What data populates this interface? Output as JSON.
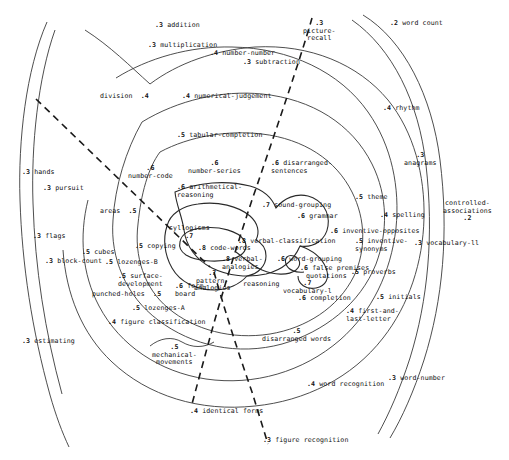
{
  "figure": {
    "type": "radex-contour-map",
    "title": "",
    "colors": {
      "contour": "#3a3a3a",
      "divider": "#1a1a1a",
      "text": "#111111",
      "background": "#ffffff"
    }
  },
  "chart_data": {
    "type": "scatter",
    "title": "",
    "xlabel": "",
    "ylabel": "",
    "grid": false,
    "legend": null,
    "annotations": [
      "dashed radial divider lines partition the radex into sectors"
    ],
    "points": [
      {
        "label": "addition",
        "value": ".3",
        "value_pos": "before",
        "x": 155,
        "y": 22,
        "align": "left"
      },
      {
        "label": "multiplication",
        "value": ".3",
        "value_pos": "before",
        "x": 148,
        "y": 42,
        "align": "left"
      },
      {
        "label": "number-number",
        "value": ".4",
        "value_pos": "before",
        "x": 210,
        "y": 50,
        "align": "left"
      },
      {
        "label": "subtraction",
        "value": ".3",
        "value_pos": "before",
        "x": 243,
        "y": 59,
        "align": "left"
      },
      {
        "label": "picture-\nrecall",
        "value": ".3",
        "value_pos": "above",
        "x": 303,
        "y": 20,
        "align": "left"
      },
      {
        "label": "word count",
        "value": ".2",
        "value_pos": "before",
        "x": 390,
        "y": 20,
        "align": "left"
      },
      {
        "label": "division",
        "value": ".4",
        "value_pos": "after",
        "x": 100,
        "y": 93,
        "align": "left"
      },
      {
        "label": "numerical-judgement",
        "value": ".4",
        "value_pos": "before",
        "x": 182,
        "y": 93,
        "align": "left"
      },
      {
        "label": "rhythm",
        "value": ".4",
        "value_pos": "before",
        "x": 383,
        "y": 105,
        "align": "left"
      },
      {
        "label": "tabular-completion",
        "value": ".5",
        "value_pos": "before",
        "x": 177,
        "y": 132,
        "align": "left"
      },
      {
        "label": "anagrams",
        "value": ".3",
        "value_pos": "above",
        "x": 404,
        "y": 152,
        "align": "left"
      },
      {
        "label": "number-code",
        "value": ".6",
        "value_pos": "above",
        "x": 128,
        "y": 165,
        "align": "left"
      },
      {
        "label": "number-series",
        "value": ".6",
        "value_pos": "above",
        "x": 188,
        "y": 160,
        "align": "left"
      },
      {
        "label": "disarranged-\nsentences",
        "value": ".6",
        "value_pos": "before",
        "x": 271,
        "y": 160,
        "align": "left"
      },
      {
        "label": "hands",
        "value": ".3",
        "value_pos": "before",
        "x": 22,
        "y": 169,
        "align": "left"
      },
      {
        "label": "arithmetical-\nreasoning",
        "value": ".6",
        "value_pos": "before",
        "x": 177,
        "y": 184,
        "align": "left"
      },
      {
        "label": "pursuit",
        "value": ".3",
        "value_pos": "before",
        "x": 43,
        "y": 185,
        "align": "left"
      },
      {
        "label": "theme",
        "value": ".5",
        "value_pos": "before",
        "x": 355,
        "y": 194,
        "align": "left"
      },
      {
        "label": "controlled-\nassociations",
        "value": ".2",
        "value_pos": "below",
        "x": 443,
        "y": 200,
        "align": "left"
      },
      {
        "label": "sound-grouping",
        "value": ".7",
        "value_pos": "before",
        "x": 262,
        "y": 202,
        "align": "left"
      },
      {
        "label": "areas",
        "value": ".5",
        "value_pos": "after",
        "x": 100,
        "y": 208,
        "align": "left"
      },
      {
        "label": "grammar",
        "value": ".6",
        "value_pos": "before",
        "x": 297,
        "y": 213,
        "align": "left"
      },
      {
        "label": "spelling",
        "value": ".4",
        "value_pos": "before",
        "x": 380,
        "y": 212,
        "align": "left"
      },
      {
        "label": "flags",
        "value": ".3",
        "value_pos": "before",
        "x": 33,
        "y": 233,
        "align": "left"
      },
      {
        "label": "inventive-opposites",
        "value": ".6",
        "value_pos": "before",
        "x": 330,
        "y": 228,
        "align": "left"
      },
      {
        "label": "syllogisms",
        "value": ".7",
        "value_pos": "below",
        "x": 169,
        "y": 225,
        "align": "left"
      },
      {
        "label": "verbal-classification",
        "value": ".8",
        "value_pos": "before",
        "x": 238,
        "y": 238,
        "align": "left"
      },
      {
        "label": "inventive-\nsynonyms",
        "value": ".5",
        "value_pos": "before",
        "x": 355,
        "y": 238,
        "align": "left"
      },
      {
        "label": "vocabulary-ll",
        "value": ".3",
        "value_pos": "before",
        "x": 414,
        "y": 240,
        "align": "left"
      },
      {
        "label": "copying",
        "value": ".5",
        "value_pos": "before",
        "x": 135,
        "y": 243,
        "align": "left"
      },
      {
        "label": "code-words",
        "value": ".8",
        "value_pos": "before",
        "x": 198,
        "y": 245,
        "align": "left"
      },
      {
        "label": "cubes",
        "value": ".5",
        "value_pos": "before",
        "x": 82,
        "y": 249,
        "align": "left"
      },
      {
        "label": "block-count",
        "value": ".3",
        "value_pos": "before",
        "x": 45,
        "y": 258,
        "align": "left"
      },
      {
        "label": "lozenges-B",
        "value": ".5",
        "value_pos": "before",
        "x": 105,
        "y": 259,
        "align": "left"
      },
      {
        "label": "verbal-\nanalogies",
        "value": ".8",
        "value_pos": "before",
        "x": 222,
        "y": 256,
        "align": "left"
      },
      {
        "label": "word-grouping",
        "value": ".6",
        "value_pos": "before",
        "x": 277,
        "y": 256,
        "align": "left"
      },
      {
        "label": "false premises",
        "value": ".6",
        "value_pos": "before",
        "x": 300,
        "y": 265,
        "align": "left"
      },
      {
        "label": "proverbs",
        "value": ".5",
        "value_pos": "before",
        "x": 351,
        "y": 269,
        "align": "left"
      },
      {
        "label": "surface-\ndevelopment",
        "value": ".5",
        "value_pos": "before",
        "x": 118,
        "y": 273,
        "align": "left"
      },
      {
        "label": "pattern-\nanalogies",
        "value": ".7",
        "value_pos": "above",
        "x": 194,
        "y": 270,
        "align": "left"
      },
      {
        "label": "quotations",
        "value": ".6",
        "value_pos": "none",
        "x": 306,
        "y": 273,
        "align": "left"
      },
      {
        "label": "form-\nboard",
        "value": ".6",
        "value_pos": "before",
        "x": 175,
        "y": 283,
        "align": "left"
      },
      {
        "label": "reasoning",
        "value": ".6",
        "value_pos": "none",
        "x": 243,
        "y": 281,
        "align": "left"
      },
      {
        "label": "vocabulary-l",
        "value": ".7",
        "value_pos": "above",
        "x": 283,
        "y": 280,
        "align": "left"
      },
      {
        "label": "punched-holes",
        "value": ".5",
        "value_pos": "after",
        "x": 92,
        "y": 291,
        "align": "left"
      },
      {
        "label": "completion",
        "value": ".6",
        "value_pos": "before",
        "x": 298,
        "y": 295,
        "align": "left"
      },
      {
        "label": "initials",
        "value": ".5",
        "value_pos": "before",
        "x": 376,
        "y": 294,
        "align": "left"
      },
      {
        "label": "lozenges-A",
        "value": ".5",
        "value_pos": "before",
        "x": 132,
        "y": 305,
        "align": "left"
      },
      {
        "label": "first-and-\nlast-letter",
        "value": ".4",
        "value_pos": "before",
        "x": 346,
        "y": 308,
        "align": "left"
      },
      {
        "label": "figure classification",
        "value": ".4",
        "value_pos": "before",
        "x": 108,
        "y": 319,
        "align": "left"
      },
      {
        "label": "disarranged words",
        "value": ".5",
        "value_pos": "above",
        "x": 262,
        "y": 328,
        "align": "left"
      },
      {
        "label": "estimating",
        "value": ".3",
        "value_pos": "before",
        "x": 22,
        "y": 338,
        "align": "left"
      },
      {
        "label": "mechanical-\nmovements",
        "value": ".5",
        "value_pos": "above",
        "x": 152,
        "y": 344,
        "align": "left"
      },
      {
        "label": "word recognition",
        "value": ".4",
        "value_pos": "before",
        "x": 307,
        "y": 381,
        "align": "left"
      },
      {
        "label": "word-number",
        "value": ".3",
        "value_pos": "before",
        "x": 388,
        "y": 375,
        "align": "left"
      },
      {
        "label": "identical forms",
        "value": ".4",
        "value_pos": "before",
        "x": 190,
        "y": 408,
        "align": "left"
      },
      {
        "label": "figure recognition",
        "value": ".3",
        "value_pos": "before",
        "x": 263,
        "y": 437,
        "align": "left"
      }
    ]
  }
}
